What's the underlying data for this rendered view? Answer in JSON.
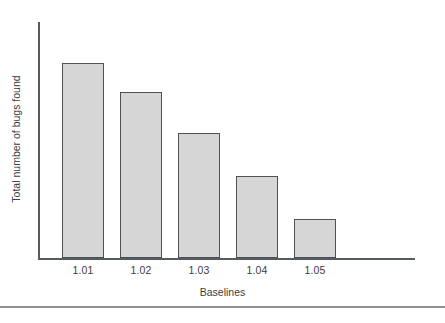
{
  "chart_data": {
    "type": "bar",
    "title": "",
    "subtitle": "",
    "xlabel": "Baselines",
    "ylabel": "Total number of bugs found",
    "categories": [
      "1.01",
      "1.02",
      "1.03",
      "1.04",
      "1.05"
    ],
    "values": [
      100,
      85,
      64,
      42,
      20
    ],
    "ylim": [
      0,
      121
    ],
    "grid": false,
    "legend": null,
    "legend_position": "none",
    "axis_tick_labels_y": [],
    "annotations": [],
    "series": [
      {
        "name": "Total number of bugs found",
        "values": [
          100,
          85,
          64,
          42,
          20
        ]
      }
    ],
    "bar_fill_color": "#d6d6d6",
    "bar_edge_color": "#4d5355",
    "axis_color": "#555b5e"
  },
  "footer": {
    "caption": "",
    "rule_color": "#8e9194"
  }
}
